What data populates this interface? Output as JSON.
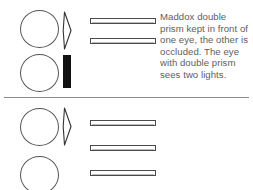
{
  "figure": {
    "background_color": "#ffffff",
    "outline_color": "#555555",
    "occluder_color": "#111111",
    "text_color": "#5e5e5e"
  },
  "panels": [
    {
      "id": "top",
      "caption": "Maddox double prism kept in front of one eye, the other is occluded. The eye with double prism sees two lights.",
      "eyes": [
        {
          "name": "eye-with-prism",
          "state": "open"
        },
        {
          "name": "eye-occluded",
          "state": "occluded"
        }
      ],
      "optics": [
        {
          "name": "double-prism",
          "label": "double prism"
        },
        {
          "name": "occluder",
          "label": "occluder"
        }
      ],
      "lights": [
        {
          "name": "light-1"
        },
        {
          "name": "light-2"
        }
      ],
      "light_count": 2
    },
    {
      "id": "bottom",
      "caption": "Maddox double prism kept in front of one eye. The other eyes is kept open. Both eyes together see three lights.",
      "eyes": [
        {
          "name": "eye-with-prism",
          "state": "open"
        },
        {
          "name": "eye-open",
          "state": "open"
        }
      ],
      "optics": [
        {
          "name": "double-prism",
          "label": "double prism"
        }
      ],
      "lights": [
        {
          "name": "light-1"
        },
        {
          "name": "light-2"
        },
        {
          "name": "light-3"
        }
      ],
      "light_count": 3
    }
  ]
}
